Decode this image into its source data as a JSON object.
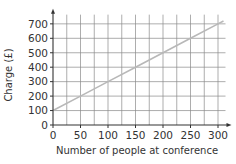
{
  "chart_data": {
    "type": "line",
    "title": "",
    "xlabel": "Number of people at conference",
    "ylabel": "Charge (£)",
    "xlim": [
      0,
      310
    ],
    "ylim": [
      0,
      750
    ],
    "x_ticks": [
      0,
      50,
      100,
      150,
      200,
      250,
      300
    ],
    "y_ticks": [
      0,
      100,
      200,
      300,
      400,
      500,
      600,
      700
    ],
    "x_minor_grid_step": 25,
    "y_grid_step": 100,
    "grid": true,
    "legend": null,
    "series": [
      {
        "name": "Charge",
        "color": "#b8b8b8",
        "x": [
          0,
          50,
          100,
          150,
          200,
          250,
          300,
          310
        ],
        "y": [
          100,
          200,
          300,
          400,
          500,
          600,
          700,
          720
        ]
      }
    ]
  },
  "colors": {
    "axis": "#333333",
    "grid": "#8a8a8a",
    "line": "#b8b8b8",
    "text": "#333333"
  }
}
